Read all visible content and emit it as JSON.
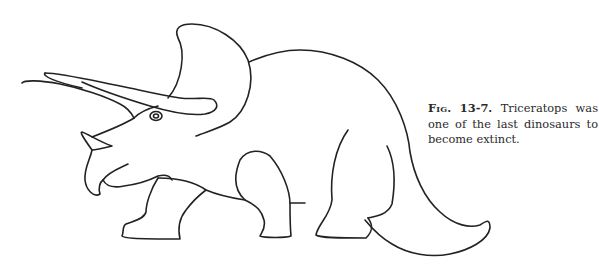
{
  "figure": {
    "illustration": "triceratops-line-drawing",
    "stroke_color": "#222222",
    "background_color": "#ffffff"
  },
  "caption": {
    "label": "Fig.",
    "number": "13-7.",
    "text": "Triceratops was one of the last dinosaurs to become extinct."
  }
}
